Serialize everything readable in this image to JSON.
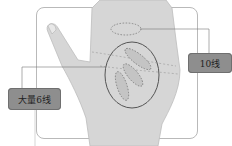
{
  "illustration": {
    "subject": "palm-lines-diagram",
    "labels": {
      "left": "大量6线",
      "right": "10线"
    },
    "colors": {
      "label_bg": "#8e8e8e",
      "frame": "#b9b9b9",
      "skin": "#d2d2d2",
      "outline": "#555555"
    }
  }
}
